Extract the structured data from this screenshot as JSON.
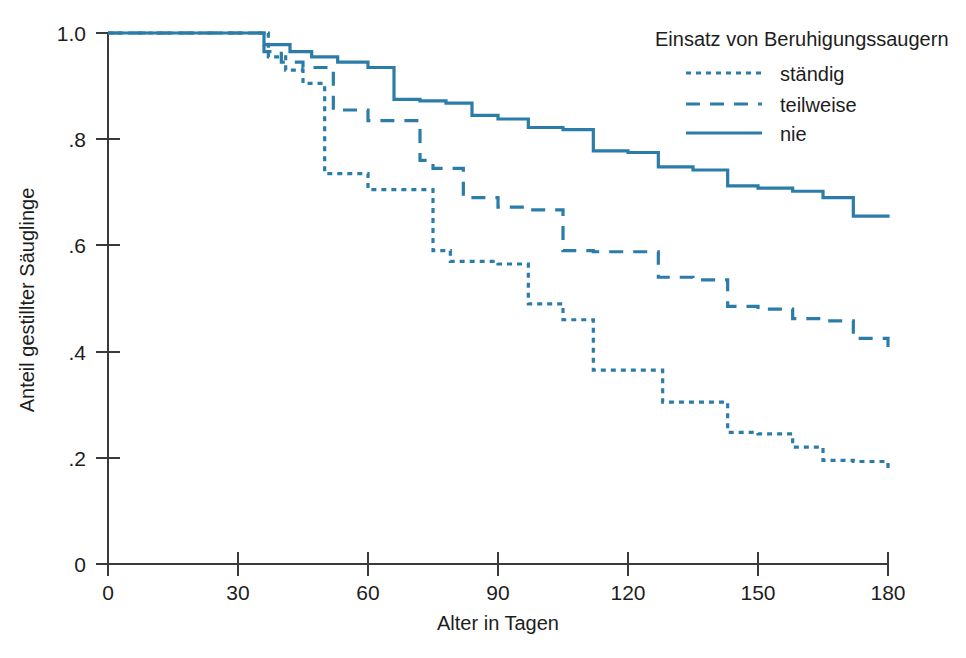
{
  "chart_data": {
    "type": "line",
    "title": "",
    "xlabel": "Alter in Tagen",
    "ylabel": "Anteil gestillter Säuglinge",
    "xlim": [
      0,
      180
    ],
    "ylim": [
      0,
      1.0
    ],
    "xticks": [
      0,
      30,
      60,
      90,
      120,
      150,
      180
    ],
    "xticklabels": [
      "0",
      "30",
      "60",
      "90",
      "120",
      "150",
      "180"
    ],
    "yticks": [
      0,
      0.2,
      0.4,
      0.6,
      0.8,
      1.0
    ],
    "yticklabels": [
      "0",
      ".2",
      ".4",
      ".6",
      ".8",
      "1.0"
    ],
    "grid": false,
    "legend_position": "top-right",
    "legend_title": "Einsatz von Beruhigungssaugern",
    "accent_color": "#2b7ca8",
    "axis_color": "#3a3a3a",
    "step_style": "post",
    "series": [
      {
        "name": "ständig",
        "dash": "dotted",
        "dasharray": "5 5",
        "x": [
          0,
          30,
          37,
          41,
          45,
          50,
          60,
          66,
          75,
          79,
          90,
          97,
          105,
          112,
          120,
          128,
          135,
          143,
          150,
          158,
          165,
          172,
          180
        ],
        "y": [
          1.0,
          1.0,
          0.955,
          0.93,
          0.905,
          0.735,
          0.705,
          0.705,
          0.59,
          0.57,
          0.565,
          0.49,
          0.46,
          0.365,
          0.365,
          0.305,
          0.305,
          0.248,
          0.245,
          0.22,
          0.195,
          0.193,
          0.178
        ]
      },
      {
        "name": "teilweise",
        "dash": "dashed",
        "dasharray": "14 10",
        "x": [
          0,
          30,
          36,
          40,
          45,
          52,
          60,
          66,
          72,
          75,
          82,
          90,
          97,
          105,
          112,
          120,
          127,
          135,
          143,
          150,
          158,
          165,
          172,
          180
        ],
        "y": [
          1.0,
          1.0,
          0.965,
          0.945,
          0.935,
          0.855,
          0.835,
          0.835,
          0.76,
          0.745,
          0.69,
          0.672,
          0.667,
          0.59,
          0.588,
          0.588,
          0.54,
          0.535,
          0.485,
          0.48,
          0.462,
          0.458,
          0.425,
          0.403
        ]
      },
      {
        "name": "nie",
        "dash": "solid",
        "dasharray": "none",
        "x": [
          0,
          30,
          36,
          42,
          47,
          53,
          60,
          66,
          72,
          78,
          84,
          90,
          97,
          105,
          112,
          120,
          127,
          135,
          143,
          150,
          158,
          165,
          172,
          180
        ],
        "y": [
          1.0,
          1.0,
          0.978,
          0.965,
          0.955,
          0.945,
          0.935,
          0.875,
          0.872,
          0.868,
          0.845,
          0.838,
          0.822,
          0.818,
          0.778,
          0.775,
          0.748,
          0.742,
          0.712,
          0.708,
          0.702,
          0.69,
          0.655,
          0.652
        ]
      }
    ]
  },
  "legend": {
    "title": "Einsatz von Beruhigungssaugern",
    "items": [
      {
        "label": "ständig"
      },
      {
        "label": "teilweise"
      },
      {
        "label": "nie"
      }
    ]
  },
  "axes": {
    "x_title": "Alter in Tagen",
    "y_title": "Anteil gestillter Säuglinge",
    "x_labels": [
      "0",
      "30",
      "60",
      "90",
      "120",
      "150",
      "180"
    ],
    "y_labels": [
      "1.0",
      ".8",
      ".6",
      ".4",
      ".2",
      "0"
    ]
  }
}
